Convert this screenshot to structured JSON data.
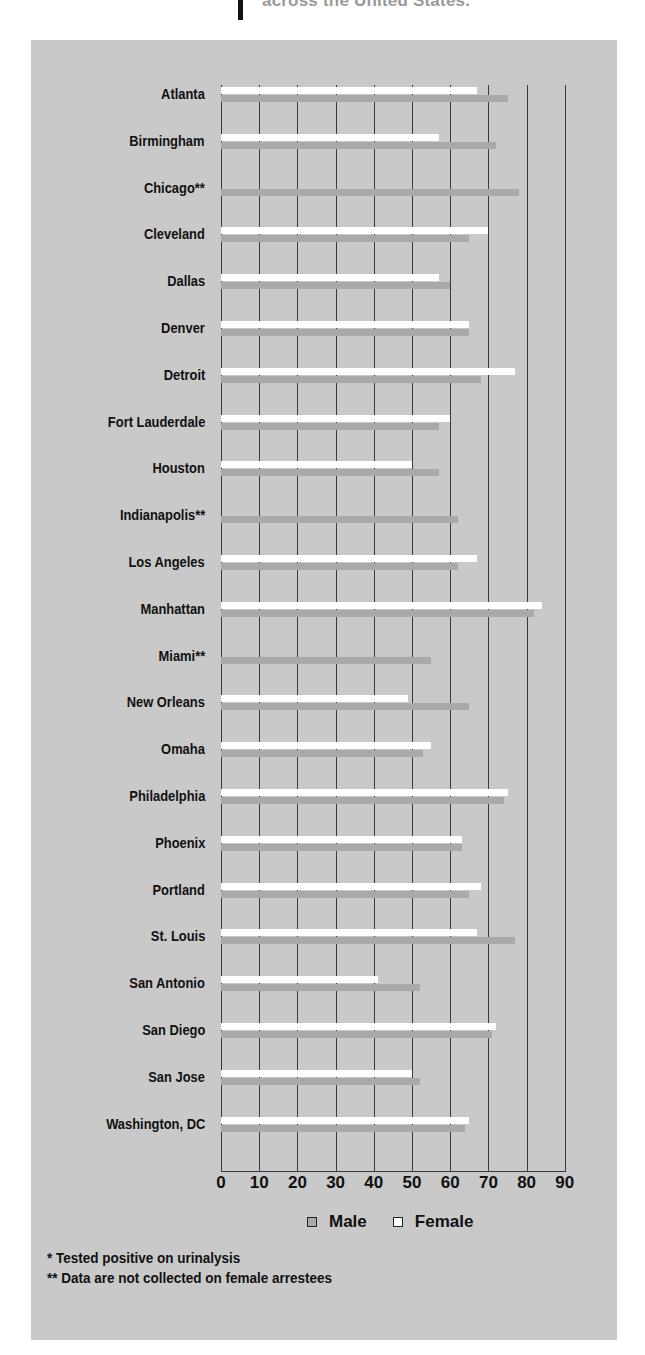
{
  "header": {
    "text": "across the United States."
  },
  "legend": {
    "male_label": "Male",
    "female_label": "Female"
  },
  "footnotes": [
    "* Tested positive on urinalysis",
    "** Data are not collected on female arrestees"
  ],
  "colors": {
    "panel": "#c9c9c9",
    "male": "#a9a9a9",
    "female": "#ffffff",
    "grid": "#3a3a3a"
  },
  "chart_data": {
    "type": "bar",
    "orientation": "horizontal",
    "title": "",
    "xlabel": "",
    "ylabel": "",
    "xlim": [
      0,
      90
    ],
    "xticks": [
      0,
      10,
      20,
      30,
      40,
      50,
      60,
      70,
      80,
      90
    ],
    "grid": "vertical lines at each tick",
    "legend_position": "bottom",
    "categories": [
      "Atlanta",
      "Birmingham",
      "Chicago**",
      "Cleveland",
      "Dallas",
      "Denver",
      "Detroit",
      "Fort Lauderdale",
      "Houston",
      "Indianapolis**",
      "Los Angeles",
      "Manhattan",
      "Miami**",
      "New Orleans",
      "Omaha",
      "Philadelphia",
      "Phoenix",
      "Portland",
      "St. Louis",
      "San Antonio",
      "San Diego",
      "San Jose",
      "Washington, DC"
    ],
    "series": [
      {
        "name": "Female",
        "values": [
          67,
          57,
          null,
          70,
          57,
          65,
          77,
          60,
          50,
          null,
          67,
          84,
          null,
          49,
          55,
          75,
          63,
          68,
          67,
          41,
          72,
          50,
          65
        ]
      },
      {
        "name": "Male",
        "values": [
          75,
          72,
          78,
          65,
          60,
          65,
          68,
          57,
          57,
          62,
          62,
          82,
          55,
          65,
          53,
          74,
          63,
          65,
          77,
          52,
          71,
          52,
          64
        ]
      }
    ],
    "annotations": [
      "* Tested positive on urinalysis",
      "** Data are not collected on female arrestees"
    ]
  }
}
